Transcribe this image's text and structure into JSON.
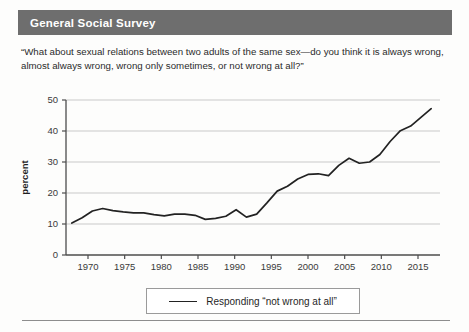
{
  "header": {
    "title": "General Social Survey",
    "band_color": "#6e6e6e"
  },
  "question": "“What about sexual relations between two adults of the same sex—do you think it is always wrong, almost always wrong, wrong only sometimes, or not wrong at all?”",
  "legend": {
    "entries": [
      {
        "label": "Responding “not wrong at all”",
        "color": "#222222"
      }
    ]
  },
  "chart_data": {
    "type": "line",
    "title": "",
    "xlabel": "",
    "ylabel": "percent",
    "xlim": [
      1967,
      2018
    ],
    "ylim": [
      0,
      50
    ],
    "grid": true,
    "legend_position": "bottom",
    "xticks": [
      1970,
      1975,
      1980,
      1985,
      1990,
      1995,
      2000,
      2005,
      2010,
      2015
    ],
    "yticks": [
      0,
      10,
      20,
      30,
      40,
      50
    ],
    "series": [
      {
        "name": "Responding “not wrong at all”",
        "color": "#222222",
        "x": [
          1973,
          1974,
          1976,
          1977,
          1980,
          1982,
          1984,
          1985,
          1987,
          1988,
          1989,
          1990,
          1991,
          1993,
          1994,
          1996,
          1998,
          2000,
          2002,
          2004,
          2006,
          2008,
          2010,
          2012,
          2014,
          2016,
          2017
        ],
        "y": [
          11,
          13,
          15,
          14,
          14,
          14,
          13,
          14,
          12,
          12,
          15,
          13,
          15,
          22,
          22,
          26,
          28,
          29,
          32,
          30,
          32,
          36,
          41,
          44,
          49,
          51,
          52
        ]
      }
    ],
    "series_display": {
      "note": "values plotted are the percent responding 'not wrong at all'",
      "x": [
        1967.8,
        1969.2,
        1970.6,
        1972.0,
        1973.4,
        1974.8,
        1976.2,
        1977.6,
        1979.0,
        1980.4,
        1981.8,
        1983.2,
        1984.6,
        1986.0,
        1987.4,
        1988.8,
        1990.2,
        1991.6,
        1993.0,
        1994.4,
        1995.8,
        1997.2,
        1998.6,
        2000.0,
        2001.4,
        2002.8,
        2004.2,
        2005.6,
        2007.0,
        2008.4,
        2009.8,
        2011.2,
        2012.6,
        2014.0,
        2015.4,
        2016.8
      ],
      "y": [
        10.3,
        12.0,
        14.2,
        15.0,
        14.3,
        13.9,
        13.6,
        13.6,
        13.0,
        12.6,
        13.2,
        13.2,
        12.8,
        11.5,
        11.8,
        12.5,
        14.6,
        12.2,
        13.2,
        16.8,
        20.6,
        22.2,
        24.5,
        26.0,
        26.2,
        25.6,
        28.9,
        31.2,
        29.6,
        30.0,
        32.4,
        36.6,
        40.1,
        41.6,
        44.4,
        47.2
      ]
    }
  }
}
